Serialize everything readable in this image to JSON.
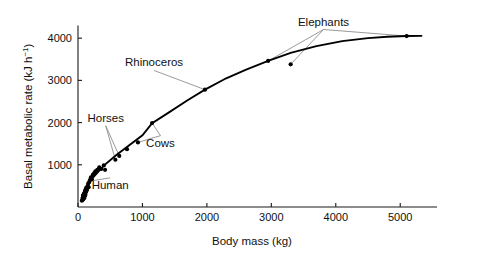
{
  "chart_data": {
    "type": "scatter",
    "title": "",
    "xlabel": "Body mass (kg)",
    "ylabel": "Basal metabolic rate (kJ h−1)",
    "ylabel_base": "Basal metabolic rate (kJ h",
    "ylabel_exponent": "−1",
    "ylabel_close": ")",
    "xlim": [
      0,
      5400
    ],
    "ylim": [
      0,
      4300
    ],
    "xticks": [
      0,
      1000,
      2000,
      3000,
      4000,
      5000
    ],
    "xticklabels": [
      "0",
      "1000",
      "2000",
      "3000",
      "4000",
      "5000"
    ],
    "yticks": [
      1000,
      2000,
      3000,
      4000
    ],
    "yticklabels": [
      "1000",
      "2000",
      "3000",
      "4000"
    ],
    "grid": false,
    "legend": "none",
    "point_color": "#000000",
    "curve_color": "#000000",
    "leader_color": "#888888",
    "points": [
      [
        60,
        150
      ],
      [
        70,
        190
      ],
      [
        75,
        230
      ],
      [
        80,
        175
      ],
      [
        85,
        265
      ],
      [
        90,
        300
      ],
      [
        95,
        210
      ],
      [
        100,
        330
      ],
      [
        105,
        255
      ],
      [
        110,
        380
      ],
      [
        115,
        290
      ],
      [
        120,
        420
      ],
      [
        125,
        355
      ],
      [
        130,
        460
      ],
      [
        140,
        400
      ],
      [
        150,
        500
      ],
      [
        160,
        560
      ],
      [
        165,
        470
      ],
      [
        175,
        590
      ],
      [
        185,
        640
      ],
      [
        200,
        700
      ],
      [
        215,
        660
      ],
      [
        230,
        760
      ],
      [
        250,
        800
      ],
      [
        270,
        845
      ],
      [
        300,
        880
      ],
      [
        330,
        940
      ],
      [
        360,
        900
      ],
      [
        400,
        985
      ],
      [
        420,
        880
      ],
      [
        580,
        1120
      ],
      [
        640,
        1210
      ],
      [
        760,
        1370
      ],
      [
        930,
        1530
      ],
      [
        1150,
        1990
      ],
      [
        1970,
        2780
      ],
      [
        2950,
        3460
      ],
      [
        3300,
        3380
      ],
      [
        5100,
        4050
      ]
    ],
    "curve": [
      [
        60,
        280
      ],
      [
        200,
        640
      ],
      [
        400,
        980
      ],
      [
        600,
        1240
      ],
      [
        800,
        1470
      ],
      [
        1000,
        1700
      ],
      [
        1150,
        1985
      ],
      [
        1400,
        2230
      ],
      [
        1700,
        2530
      ],
      [
        1970,
        2780
      ],
      [
        2300,
        3050
      ],
      [
        2600,
        3250
      ],
      [
        2950,
        3460
      ],
      [
        3300,
        3650
      ],
      [
        3700,
        3810
      ],
      [
        4100,
        3930
      ],
      [
        4500,
        4000
      ],
      [
        4800,
        4035
      ],
      [
        5100,
        4050
      ],
      [
        5330,
        4055
      ]
    ],
    "annotations": [
      {
        "label": "Elephants",
        "label_x": 3810,
        "label_y": 4300,
        "targets": [
          [
            2950,
            3460
          ],
          [
            3300,
            3380
          ],
          [
            5100,
            4050
          ]
        ]
      },
      {
        "label": "Rhinoceros",
        "label_x": 1180,
        "label_y": 3330,
        "targets": [
          [
            1970,
            2780
          ]
        ]
      },
      {
        "label": "Horses",
        "label_x": 430,
        "label_y": 2020,
        "targets": [
          [
            580,
            1120
          ],
          [
            640,
            1210
          ]
        ]
      },
      {
        "label": "Cows",
        "label_x": 1280,
        "label_y": 1430,
        "targets": [
          [
            1150,
            1990
          ],
          [
            930,
            1530
          ]
        ]
      },
      {
        "label": "Human",
        "label_x": 500,
        "label_y": 430,
        "targets": [
          [
            205,
            620
          ]
        ]
      }
    ]
  }
}
